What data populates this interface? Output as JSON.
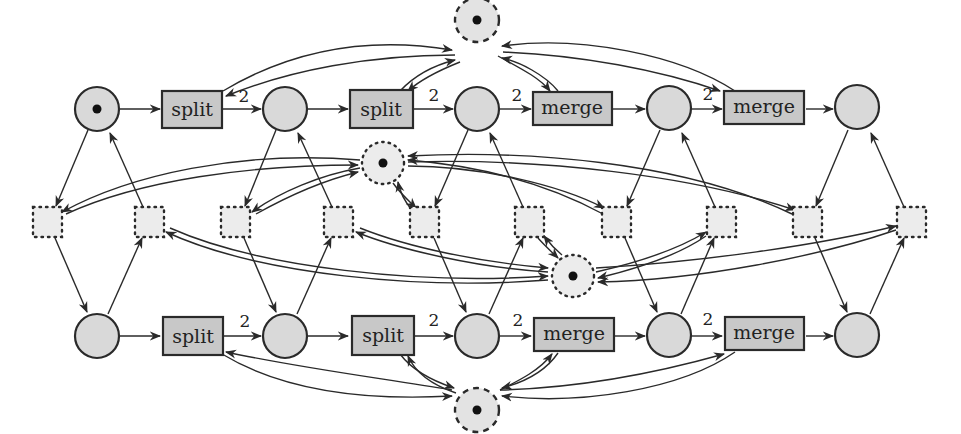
{
  "diagram": {
    "type": "petri-net",
    "colors": {
      "place_fill": "#d9d9d9",
      "transition_fill": "#c8c8c8",
      "aux_fill": "#ececec",
      "stroke": "#2a2a2a",
      "token": "#111111"
    },
    "top_row": {
      "places": [
        {
          "id": "p_top_1",
          "token": true
        },
        {
          "id": "p_top_2",
          "token": false
        },
        {
          "id": "p_top_3",
          "token": false
        },
        {
          "id": "p_top_4",
          "token": false
        },
        {
          "id": "p_top_5",
          "token": false
        }
      ],
      "transitions": [
        {
          "id": "t_top_1",
          "label": "split"
        },
        {
          "id": "t_top_2",
          "label": "split"
        },
        {
          "id": "t_top_3",
          "label": "merge"
        },
        {
          "id": "t_top_4",
          "label": "merge"
        }
      ],
      "weights": [
        "2",
        "2",
        "2",
        "2"
      ]
    },
    "bottom_row": {
      "places": [
        {
          "id": "p_bot_1",
          "token": false
        },
        {
          "id": "p_bot_2",
          "token": false
        },
        {
          "id": "p_bot_3",
          "token": false
        },
        {
          "id": "p_bot_4",
          "token": false
        },
        {
          "id": "p_bot_5",
          "token": false
        }
      ],
      "transitions": [
        {
          "id": "t_bot_1",
          "label": "split"
        },
        {
          "id": "t_bot_2",
          "label": "split"
        },
        {
          "id": "t_bot_3",
          "label": "merge"
        },
        {
          "id": "t_bot_4",
          "label": "merge"
        }
      ],
      "weights": [
        "2",
        "2",
        "2",
        "2"
      ]
    },
    "resource_places": [
      {
        "id": "r_top",
        "style": "dashed",
        "token": true
      },
      {
        "id": "r_mid_upper",
        "style": "dotted",
        "token": true
      },
      {
        "id": "r_mid_lower",
        "style": "dotted",
        "token": true
      },
      {
        "id": "r_bottom",
        "style": "dashed",
        "token": true
      }
    ],
    "aux_transitions_count": 10
  }
}
